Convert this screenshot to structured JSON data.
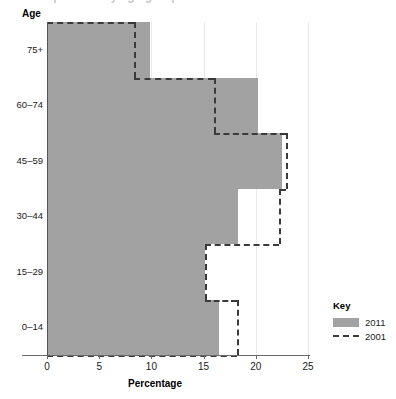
{
  "title": {
    "text": "Population by age group",
    "cropped": true
  },
  "axes": {
    "y_title": "Age",
    "x_title": "Percentage",
    "x_ticks": [
      "0",
      "5",
      "10",
      "15",
      "20",
      "25"
    ],
    "y_ticks": [
      "0–14",
      "15–29",
      "30–44",
      "45–59",
      "60–74",
      "75+"
    ]
  },
  "legend": {
    "title": "Key",
    "entries": [
      {
        "label": "2011",
        "style": "filled",
        "color": "#a2a2a2"
      },
      {
        "label": "2001",
        "style": "dashed",
        "color": "#3a3a3a"
      }
    ]
  },
  "colors": {
    "bar_fill": "#a2a2a2",
    "dash_stroke": "#3a3a3a",
    "gridline": "#e9e9e9",
    "axis": "#6b6b6b"
  },
  "chart_data": {
    "type": "bar",
    "orientation": "horizontal",
    "title": "Population by age group",
    "xlabel": "Percentage",
    "ylabel": "Age",
    "xlim": [
      0,
      25
    ],
    "grid": true,
    "legend_position": "right",
    "categories": [
      "0–14",
      "15–29",
      "30–44",
      "45–59",
      "60–74",
      "75+"
    ],
    "series": [
      {
        "name": "2011",
        "style": "filled",
        "values": [
          16.5,
          15.1,
          18.3,
          22.5,
          20.2,
          9.9
        ]
      },
      {
        "name": "2001",
        "style": "dashed-outline",
        "values": [
          18.2,
          15.1,
          22.2,
          22.9,
          16.0,
          8.3
        ]
      }
    ]
  }
}
